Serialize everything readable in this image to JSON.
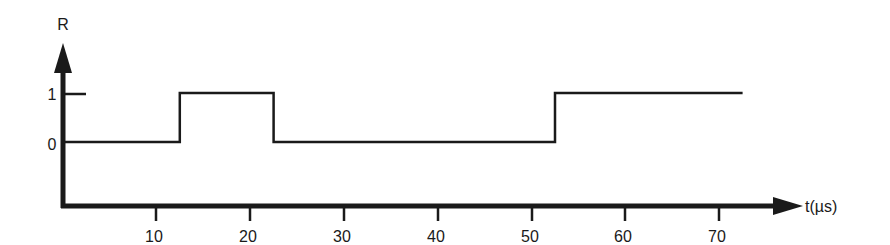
{
  "figure": {
    "y_axis_label": "R",
    "x_axis_label": "t(µs)",
    "y_ticks": [
      {
        "value": 1,
        "label": "1"
      },
      {
        "value": 0,
        "label": "0"
      }
    ],
    "x_ticks": [
      {
        "value": 10,
        "label": "10"
      },
      {
        "value": 20,
        "label": "20"
      },
      {
        "value": 30,
        "label": "30"
      },
      {
        "value": 40,
        "label": "40"
      },
      {
        "value": 50,
        "label": "50"
      },
      {
        "value": 60,
        "label": "60"
      },
      {
        "value": 70,
        "label": "70"
      }
    ],
    "line_color": "#1a1a1a"
  },
  "chart_data": {
    "type": "line",
    "title": "",
    "xlabel": "t(µs)",
    "ylabel": "R",
    "step": true,
    "xlim": [
      0,
      75
    ],
    "ylim": [
      0,
      1
    ],
    "x_ticks": [
      10,
      20,
      30,
      40,
      50,
      60,
      70
    ],
    "y_ticks": [
      0,
      1
    ],
    "series": [
      {
        "name": "R",
        "points": [
          {
            "x": 0,
            "y": 0
          },
          {
            "x": 12.5,
            "y": 0
          },
          {
            "x": 12.5,
            "y": 1
          },
          {
            "x": 22.5,
            "y": 1
          },
          {
            "x": 22.5,
            "y": 0
          },
          {
            "x": 52.5,
            "y": 0
          },
          {
            "x": 52.5,
            "y": 1
          },
          {
            "x": 72.5,
            "y": 1
          }
        ],
        "transitions": [
          {
            "t": 12.5,
            "from": 0,
            "to": 1
          },
          {
            "t": 22.5,
            "from": 1,
            "to": 0
          },
          {
            "t": 52.5,
            "from": 0,
            "to": 1
          }
        ]
      }
    ],
    "grid": false,
    "legend": null
  }
}
